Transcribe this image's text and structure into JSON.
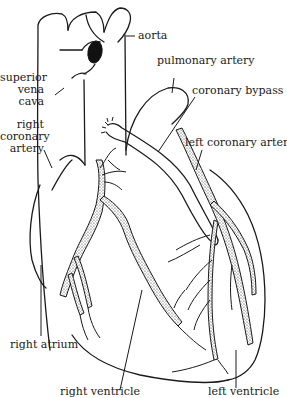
{
  "diagram": {
    "labels": {
      "aorta": "aorta",
      "superior_vena_cava_1": "superior",
      "superior_vena_cava_2": "vena",
      "superior_vena_cava_3": "cava",
      "right_coronary_artery_1": "right",
      "right_coronary_artery_2": "coronary",
      "right_coronary_artery_3": "artery",
      "pulmonary_artery": "pulmonary artery",
      "coronary_bypass": "coronary bypass",
      "left_coronary_artery": "left coronary artery",
      "right_atrium": "right atrium",
      "right_ventricle": "right ventricle",
      "left_ventricle": "left ventricle"
    },
    "colors": {
      "ink": "#1a1a1a",
      "background": "#ffffff"
    }
  }
}
